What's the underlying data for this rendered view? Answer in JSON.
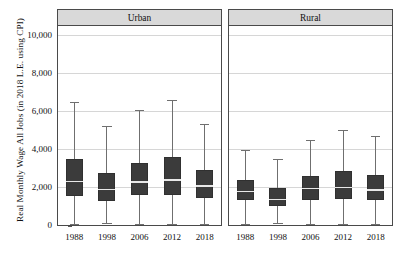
{
  "chart_data": {
    "type": "box",
    "title": "",
    "xlabel": "",
    "ylabel": "Real Monthly Wage All Jobs (in 2018 L.E. using CPI)",
    "ylim": [
      0,
      10500
    ],
    "yticks": [
      0,
      2000,
      4000,
      6000,
      8000,
      10000
    ],
    "ytick_labels": [
      "0",
      "2,000",
      "4,000",
      "6,000",
      "8,000",
      "10,000"
    ],
    "grid": true,
    "legend": "none",
    "categories": [
      "1988",
      "1998",
      "2006",
      "2012",
      "2018"
    ],
    "panels": [
      {
        "label": "Urban",
        "boxes": [
          {
            "category": "1988",
            "whisker_low": 50,
            "q1": 1550,
            "median": 2300,
            "q3": 3500,
            "whisker_high": 6500
          },
          {
            "category": "1998",
            "whisker_low": 80,
            "q1": 1280,
            "median": 1880,
            "q3": 2720,
            "whisker_high": 5200
          },
          {
            "category": "2006",
            "whisker_low": 50,
            "q1": 1570,
            "median": 2270,
            "q3": 3280,
            "whisker_high": 6050
          },
          {
            "category": "2012",
            "whisker_low": 70,
            "q1": 1580,
            "median": 2370,
            "q3": 3570,
            "whisker_high": 6600
          },
          {
            "category": "2018",
            "whisker_low": 50,
            "q1": 1430,
            "median": 2050,
            "q3": 2900,
            "whisker_high": 5330
          }
        ]
      },
      {
        "label": "Rural",
        "boxes": [
          {
            "category": "1988",
            "whisker_low": 70,
            "q1": 1300,
            "median": 1760,
            "q3": 2380,
            "whisker_high": 3950
          },
          {
            "category": "1998",
            "whisker_low": 90,
            "q1": 980,
            "median": 1340,
            "q3": 1950,
            "whisker_high": 3480
          },
          {
            "category": "2006",
            "whisker_low": 50,
            "q1": 1300,
            "median": 1930,
            "q3": 2600,
            "whisker_high": 4470
          },
          {
            "category": "2012",
            "whisker_low": 50,
            "q1": 1390,
            "median": 1980,
            "q3": 2830,
            "whisker_high": 5010
          },
          {
            "category": "2018",
            "whisker_low": 70,
            "q1": 1320,
            "median": 1850,
            "q3": 2650,
            "whisker_high": 4680
          }
        ]
      }
    ],
    "colors": {
      "box_fill": "#3b3b3b",
      "box_edge": "#303030",
      "median": "#e8e8e8",
      "whisker": "#6f6f6f",
      "gridline": "#d6d6d6",
      "panel_header_bg": "#d9d9d9",
      "frame": "#4a4a4a"
    }
  }
}
